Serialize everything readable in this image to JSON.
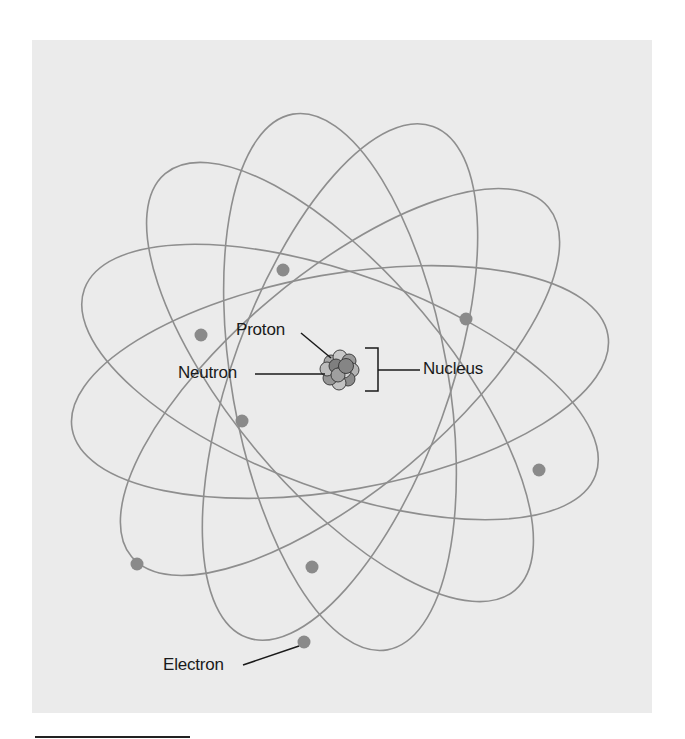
{
  "diagram": {
    "colors": {
      "panel": "#ebebeb",
      "orbit": "#8e8e8e",
      "electron": "#8a8a8a",
      "label_line": "#1a1a1a",
      "text": "#1a1a1a"
    },
    "nucleus": {
      "cx": 340,
      "cy": 369,
      "r": 20
    },
    "orbits": {
      "cx": 340,
      "cy": 382,
      "rx": 272,
      "ry": 108,
      "angles": [
        -10,
        20,
        50,
        80,
        110,
        140
      ]
    },
    "electrons": [
      {
        "x": 283,
        "y": 270
      },
      {
        "x": 201,
        "y": 335
      },
      {
        "x": 466,
        "y": 319
      },
      {
        "x": 242,
        "y": 421
      },
      {
        "x": 539,
        "y": 470
      },
      {
        "x": 137,
        "y": 564
      },
      {
        "x": 312,
        "y": 567
      },
      {
        "x": 304,
        "y": 642
      }
    ],
    "labels": {
      "proton": "Proton",
      "neutron": "Neutron",
      "nucleus": "Nucleus",
      "electron": "Electron"
    }
  }
}
